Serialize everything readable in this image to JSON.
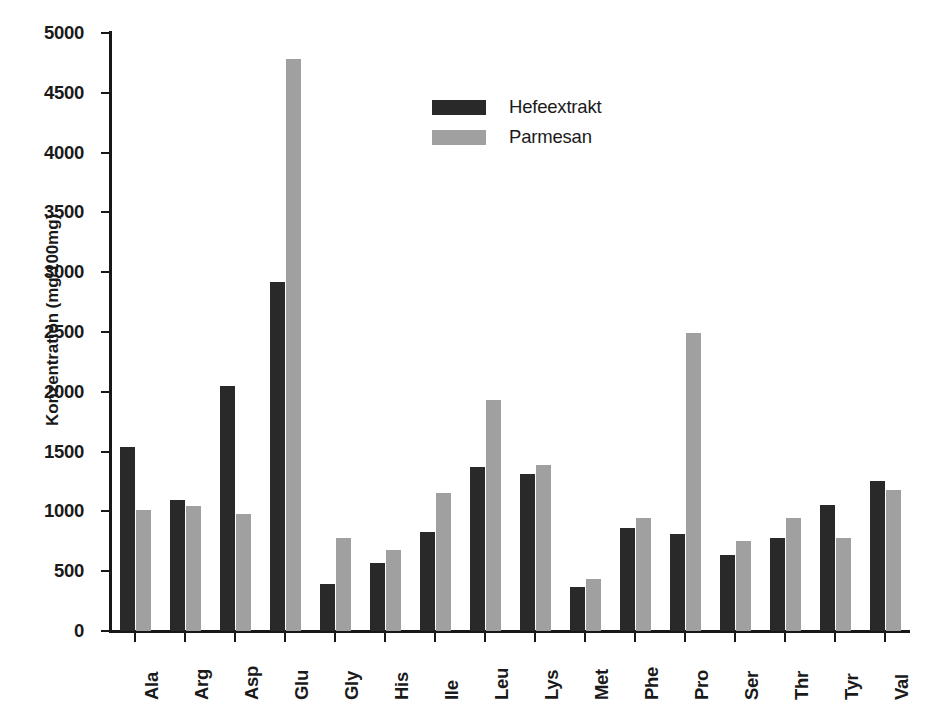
{
  "chart_data": {
    "type": "bar",
    "title": "",
    "xlabel": "",
    "ylabel": "Konzentration (mg/100mg)",
    "ylim": [
      0,
      5000
    ],
    "ytick_step": 500,
    "yticks": [
      0,
      500,
      1000,
      1500,
      2000,
      2500,
      3000,
      3500,
      4000,
      4500,
      5000
    ],
    "ytick_labels": [
      "0",
      "500",
      "1000",
      "1500",
      "2000",
      "2500",
      "3000",
      "3500",
      "4000",
      "4500",
      "5000"
    ],
    "grid": false,
    "legend_position": "upper center",
    "categories": [
      "Ala",
      "Arg",
      "Asp",
      "Glu",
      "Gly",
      "His",
      "Ile",
      "Leu",
      "Lys",
      "Met",
      "Phe",
      "Pro",
      "Ser",
      "Thr",
      "Tyr",
      "Val"
    ],
    "series": [
      {
        "name": "Hefeextrakt",
        "color": "#292929",
        "values": [
          1535,
          1095,
          2050,
          2920,
          390,
          570,
          830,
          1370,
          1310,
          365,
          865,
          810,
          635,
          780,
          1055,
          1255
        ]
      },
      {
        "name": "Parmesan",
        "color": "#a0a0a0",
        "values": [
          1010,
          1045,
          975,
          4780,
          775,
          680,
          1150,
          1935,
          1390,
          435,
          945,
          2490,
          750,
          945,
          775,
          1175
        ]
      }
    ]
  }
}
